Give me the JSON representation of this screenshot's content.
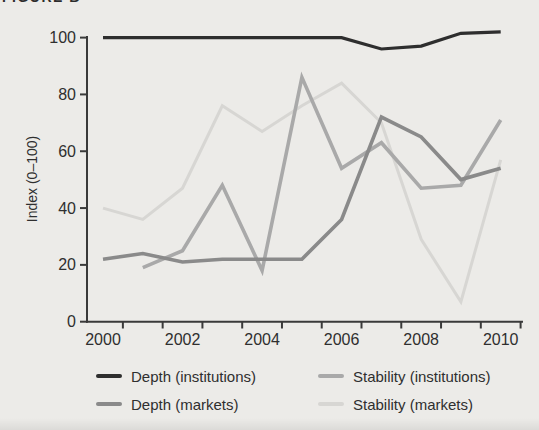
{
  "figure": {
    "title_top_cropped": "FIGURE B"
  },
  "colors": {
    "background": "#ecebe8",
    "axis": "#3a3a3a",
    "tick_text": "#2f2f2f"
  },
  "chart_data": {
    "type": "line",
    "title": "",
    "xlabel": "",
    "ylabel": "Index (0–100)",
    "xlim": [
      2000,
      2010.5
    ],
    "ylim": [
      0,
      100
    ],
    "grid": false,
    "legend_position": "bottom",
    "x": [
      2000,
      2001,
      2002,
      2003,
      2004,
      2005,
      2006,
      2007,
      2008,
      2009,
      2010
    ],
    "x_tick_labels": [
      "2000",
      "2002",
      "2004",
      "2006",
      "2008",
      "2010"
    ],
    "y_ticks": [
      0,
      20,
      40,
      60,
      80,
      100
    ],
    "series": [
      {
        "name": "Depth (institutions)",
        "color": "#2e2e2e",
        "width": 3.2,
        "values": [
          100,
          100,
          100,
          100,
          100,
          100,
          100,
          96,
          97,
          101.5,
          102
        ]
      },
      {
        "name": "Depth (markets)",
        "color": "#8a8a8a",
        "width": 3.6,
        "values": [
          22,
          24,
          21,
          22,
          22,
          22,
          36,
          72,
          65,
          50,
          54
        ]
      },
      {
        "name": "Stability (institutions)",
        "color": "#a9a9a9",
        "width": 3.6,
        "values": [
          null,
          19,
          25,
          48,
          18,
          86,
          54,
          63,
          47,
          48,
          71
        ]
      },
      {
        "name": "Stability (markets)",
        "color": "#d7d6d3",
        "width": 3.0,
        "values": [
          40,
          36,
          47,
          76,
          67,
          76,
          84,
          70,
          29,
          7,
          57
        ]
      }
    ]
  }
}
